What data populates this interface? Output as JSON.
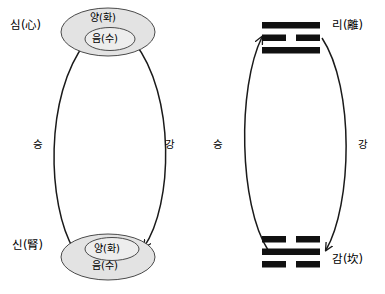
{
  "diagram": {
    "type": "two-panel conceptual diagram",
    "background_color": "#ffffff",
    "stroke_color": "#1a1a1a",
    "ellipse_fill_outer": "#e3e3e3",
    "ellipse_fill_inner": "#ededed",
    "bar_color": "#111111"
  },
  "left_panel": {
    "top_organ_label": "심(心)",
    "bottom_organ_label": "신(腎)",
    "top_node": {
      "outer_label": "양(화)",
      "inner_label": "음(수)"
    },
    "bottom_node": {
      "inner_label": "양(화)",
      "outer_label": "음(수)"
    },
    "left_flow_label": "승",
    "right_flow_label": "강"
  },
  "right_panel": {
    "top_trigram": {
      "label": "리(離)",
      "lines": [
        "solid",
        "broken",
        "solid"
      ]
    },
    "bottom_trigram": {
      "label": "감(坎)",
      "lines": [
        "broken",
        "solid",
        "broken"
      ]
    },
    "left_flow_label": "승",
    "right_flow_label": "강"
  }
}
